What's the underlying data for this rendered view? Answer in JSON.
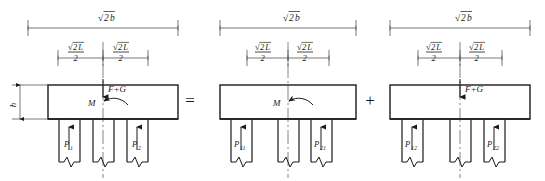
{
  "figure": {
    "operators": {
      "equals": "=",
      "plus": "+"
    },
    "colors": {
      "line": "#1a1a1a",
      "dimension_line": "#555555",
      "centerline": "#666666",
      "background": "#ffffff"
    }
  },
  "panels": [
    {
      "id": "panel-combined",
      "overall_dimension": {
        "radical": "√",
        "radicand": "2",
        "symbol": "b",
        "label": "√2b"
      },
      "half_dimensions": [
        {
          "numerator": "√2L",
          "denominator": "2",
          "label": "√2L/2"
        },
        {
          "numerator": "√2L",
          "denominator": "2",
          "label": "√2L/2"
        }
      ],
      "height_label": "h",
      "loads": [
        {
          "name": "axial-load",
          "label": "F+G",
          "type": "arrow-down"
        },
        {
          "name": "moment-load",
          "label": "M",
          "type": "moment-curved"
        }
      ],
      "piles": [
        {
          "label": "P",
          "subscript": "1",
          "reaction": true
        },
        {
          "label": "",
          "subscript": "",
          "reaction": false
        },
        {
          "label": "P",
          "subscript": "2",
          "reaction": true
        }
      ]
    },
    {
      "id": "panel-moment",
      "overall_dimension": {
        "radical": "√",
        "radicand": "2",
        "symbol": "b",
        "label": "√2b"
      },
      "half_dimensions": [
        {
          "numerator": "√2L",
          "denominator": "2",
          "label": "√2L/2"
        },
        {
          "numerator": "√2L",
          "denominator": "2",
          "label": "√2L/2"
        }
      ],
      "height_label": "",
      "loads": [
        {
          "name": "moment-load",
          "label": "M",
          "type": "moment-curved"
        }
      ],
      "piles": [
        {
          "label": "P",
          "subscript": "11",
          "reaction": true
        },
        {
          "label": "",
          "subscript": "",
          "reaction": false
        },
        {
          "label": "P",
          "subscript": "21",
          "reaction": true
        }
      ]
    },
    {
      "id": "panel-axial",
      "overall_dimension": {
        "radical": "√",
        "radicand": "2",
        "symbol": "b",
        "label": "√2b"
      },
      "half_dimensions": [
        {
          "numerator": "√2L",
          "denominator": "2",
          "label": "√2L/2"
        },
        {
          "numerator": "√2L",
          "denominator": "2",
          "label": "√2L/2"
        }
      ],
      "height_label": "",
      "loads": [
        {
          "name": "axial-load",
          "label": "F+G",
          "type": "arrow-down"
        }
      ],
      "piles": [
        {
          "label": "P",
          "subscript": "12",
          "reaction": true
        },
        {
          "label": "",
          "subscript": "",
          "reaction": false
        },
        {
          "label": "P",
          "subscript": "22",
          "reaction": true
        }
      ]
    }
  ],
  "labels": {
    "radical_sign": "√",
    "two": "2",
    "b": "b",
    "L": "L",
    "h": "h",
    "F_plus_G": "F+G",
    "M": "M",
    "P": "P",
    "sub_1": "1",
    "sub_2": "2",
    "sub_11": "11",
    "sub_21": "21",
    "sub_12": "12",
    "sub_22": "22",
    "equals": "=",
    "plus": "+"
  }
}
